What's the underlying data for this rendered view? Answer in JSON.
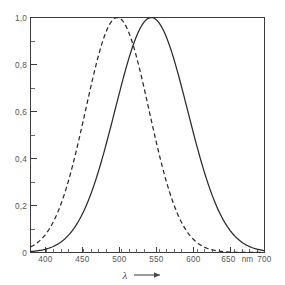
{
  "chart_data": {
    "type": "line",
    "title": "",
    "subtitle": "",
    "xlabel": "λ",
    "xunit": "nm",
    "ylabel": "",
    "xlim": [
      390,
      700
    ],
    "ylim": [
      0,
      1.0
    ],
    "grid": false,
    "legend": "none",
    "x_ticks": [
      400,
      450,
      500,
      550,
      600,
      650,
      700
    ],
    "x_tick_labels": [
      "400",
      "450",
      "500",
      "550",
      "600",
      "650",
      "700"
    ],
    "x_minor_step": 10,
    "y_ticks": [
      0,
      0.2,
      0.4,
      0.6,
      0.8,
      1.0
    ],
    "y_tick_labels": [
      "0",
      "0,2",
      "0,4",
      "0,6",
      "0,8",
      "1,0"
    ],
    "y_minor_step": 0.1,
    "decimal_separator": ",",
    "axis_arrow": "→",
    "series": [
      {
        "name": "dashed-curve",
        "style": "dashed",
        "color": "#2a2a2a",
        "peak_x": 505,
        "peak_y": 1.0,
        "sigma": 42,
        "x": [
          390,
          400,
          410,
          420,
          430,
          440,
          450,
          460,
          470,
          480,
          490,
          500,
          505,
          510,
          520,
          530,
          540,
          550,
          560,
          570,
          580,
          590,
          600,
          610,
          620,
          630,
          640,
          650,
          660,
          670,
          680,
          690,
          700
        ],
        "values": [
          0.01,
          0.03,
          0.06,
          0.11,
          0.18,
          0.27,
          0.38,
          0.5,
          0.63,
          0.75,
          0.86,
          0.99,
          1.0,
          0.99,
          0.93,
          0.83,
          0.7,
          0.56,
          0.42,
          0.3,
          0.2,
          0.12,
          0.07,
          0.04,
          0.02,
          0.01,
          0.0,
          0.0,
          0.0,
          0.0,
          0.0,
          0.0,
          0.0
        ]
      },
      {
        "name": "solid-curve",
        "style": "solid",
        "color": "#2a2a2a",
        "peak_x": 550,
        "peak_y": 1.0,
        "sigma": 48,
        "x": [
          390,
          400,
          410,
          420,
          430,
          440,
          450,
          460,
          470,
          480,
          490,
          500,
          510,
          520,
          530,
          540,
          550,
          560,
          570,
          580,
          590,
          600,
          610,
          620,
          630,
          640,
          650,
          660,
          670,
          680,
          690,
          700
        ],
        "values": [
          0.0,
          0.0,
          0.01,
          0.02,
          0.03,
          0.05,
          0.09,
          0.14,
          0.21,
          0.3,
          0.41,
          0.54,
          0.67,
          0.79,
          0.9,
          0.98,
          1.0,
          0.98,
          0.9,
          0.79,
          0.67,
          0.54,
          0.41,
          0.3,
          0.21,
          0.14,
          0.09,
          0.05,
          0.03,
          0.02,
          0.01,
          0.0
        ]
      }
    ],
    "crossing_point": {
      "x": 527,
      "y": 0.82
    },
    "colors": {
      "background": "#ffffff",
      "axis": "#3c3c3c",
      "curve": "#2a2a2a",
      "text": "#555555"
    }
  }
}
